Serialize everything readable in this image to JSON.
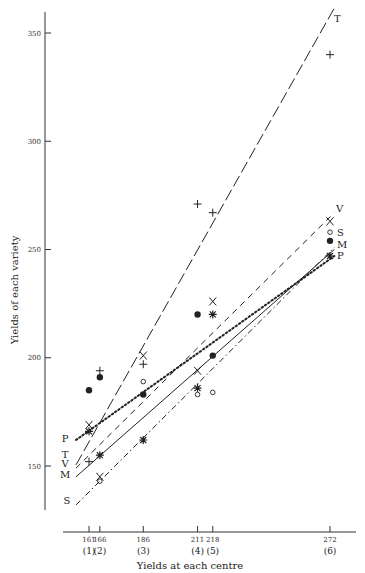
{
  "chart_data": {
    "type": "scatter",
    "title": "",
    "xlabel": "Yields at each centre",
    "ylabel": "Yields of each variety",
    "xlim": [
      156,
      276
    ],
    "ylim": [
      128,
      360
    ],
    "grid": false,
    "x_ticks": [
      161,
      166,
      186,
      211,
      218,
      272
    ],
    "x_tick_labels": [
      "161",
      "166",
      "186",
      "211",
      "218",
      "272"
    ],
    "centre_labels": [
      "(1)",
      "(2)",
      "(3)",
      "(4)",
      "(5)",
      "(6)"
    ],
    "y_ticks": [
      150,
      200,
      250,
      300,
      350
    ],
    "y_tick_labels": [
      "150",
      "200",
      "250",
      "300",
      "350"
    ],
    "series": [
      {
        "name": "T",
        "marker": "plus",
        "line_style": "long-dash",
        "points": [
          [
            161,
            152
          ],
          [
            166,
            194
          ],
          [
            186,
            197
          ],
          [
            211,
            271
          ],
          [
            218,
            267
          ],
          [
            272,
            340
          ]
        ],
        "fit_line": [
          [
            155,
            150.5
          ],
          [
            274,
            361.5
          ]
        ]
      },
      {
        "name": "V",
        "marker": "x",
        "line_style": "dash",
        "points": [
          [
            161,
            169
          ],
          [
            166,
            145
          ],
          [
            186,
            201
          ],
          [
            211,
            194
          ],
          [
            218,
            226
          ],
          [
            272,
            263
          ]
        ],
        "fit_line": [
          [
            155,
            149
          ],
          [
            274,
            267
          ]
        ]
      },
      {
        "name": "M",
        "marker": "filled-circle",
        "line_style": "solid",
        "points": [
          [
            161,
            185
          ],
          [
            166,
            191
          ],
          [
            186,
            183
          ],
          [
            211,
            220
          ],
          [
            218,
            201
          ],
          [
            272,
            254
          ]
        ],
        "fit_line": [
          [
            155,
            145
          ],
          [
            274,
            250
          ]
        ]
      },
      {
        "name": "P",
        "marker": "asterisk",
        "line_style": "dotted",
        "points": [
          [
            161,
            166
          ],
          [
            166,
            155
          ],
          [
            186,
            162
          ],
          [
            211,
            186
          ],
          [
            218,
            220
          ],
          [
            272,
            247
          ]
        ],
        "fit_line": [
          [
            155,
            162
          ],
          [
            274,
            247
          ]
        ]
      },
      {
        "name": "S",
        "marker": "open-circle",
        "line_style": "dash-dot",
        "points": [
          [
            166,
            143
          ],
          [
            186,
            189
          ],
          [
            211,
            183
          ],
          [
            218,
            184
          ],
          [
            272,
            258
          ]
        ],
        "fit_line": [
          [
            155,
            132
          ],
          [
            274,
            251
          ]
        ]
      }
    ],
    "legend": "inline labels at line ends (left: P, T, V, M, S; right: T, V, S, M, P)"
  },
  "labels": {
    "y_axis_title": "Yields of each variety",
    "x_axis_title": "Yields at each centre"
  }
}
